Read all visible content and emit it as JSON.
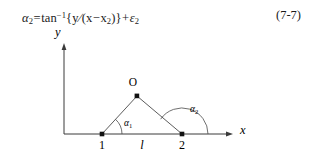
{
  "equation": {
    "number": "(7-7)",
    "lhs_symbol": "α",
    "lhs_subscript": "2",
    "equals": "=",
    "function": "tan",
    "function_exponent": "−1",
    "open_brace": "{",
    "numerator": "y",
    "divide": "∕",
    "open_paren": "(",
    "var_x": "x",
    "minus": "−",
    "var_x2": "x",
    "var_x2_subscript": "2",
    "close_paren": ")",
    "close_brace": "}",
    "plus": "+",
    "error_symbol": "ε",
    "error_subscript": "2",
    "plain_text": "α2 = tan−1{y ∕ (x − x2)} + ε2"
  },
  "figure": {
    "axis_x_label": "x",
    "axis_y_label": "y",
    "vertex_o_label": "O",
    "point_1_label": "1",
    "point_2_label": "2",
    "baseline_label": "l",
    "angle_1_symbol": "α",
    "angle_1_subscript": "1",
    "angle_2_symbol": "α",
    "angle_2_subscript": "2",
    "colors": {
      "stroke": "#3a3a3a",
      "text": "#1a1a1a",
      "background": "#ffffff"
    },
    "geometry": {
      "origin": [
        64,
        110
      ],
      "point_1": [
        102,
        110
      ],
      "point_2": [
        182,
        110
      ],
      "vertex_o": [
        137,
        72
      ],
      "x_axis_end": [
        233,
        110
      ],
      "y_axis_top": [
        64,
        21
      ]
    }
  }
}
